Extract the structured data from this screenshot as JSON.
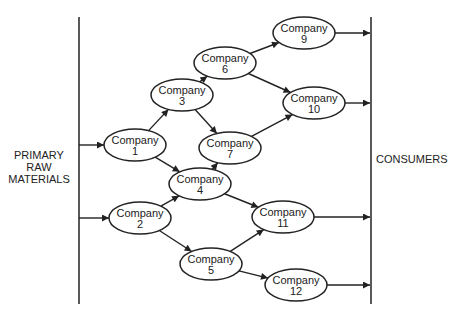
{
  "diagram": {
    "type": "supply-chain-network",
    "left_boundary": {
      "label_lines": [
        "PRIMARY",
        "RAW",
        "MATERIALS"
      ]
    },
    "right_boundary": {
      "label": "CONSUMERS"
    },
    "nodes": [
      {
        "id": "c1",
        "label": "Company",
        "number": "1",
        "cx": 135,
        "cy": 145
      },
      {
        "id": "c2",
        "label": "Company",
        "number": "2",
        "cx": 140,
        "cy": 218
      },
      {
        "id": "c3",
        "label": "Company",
        "number": "3",
        "cx": 182,
        "cy": 95
      },
      {
        "id": "c4",
        "label": "Company",
        "number": "4",
        "cx": 200,
        "cy": 184
      },
      {
        "id": "c5",
        "label": "Company",
        "number": "5",
        "cx": 211,
        "cy": 264
      },
      {
        "id": "c6",
        "label": "Company",
        "number": "6",
        "cx": 225,
        "cy": 63
      },
      {
        "id": "c7",
        "label": "Company",
        "number": "7",
        "cx": 230,
        "cy": 148
      },
      {
        "id": "c9",
        "label": "Company",
        "number": "9",
        "cx": 304,
        "cy": 33
      },
      {
        "id": "c10",
        "label": "Company",
        "number": "10",
        "cx": 314,
        "cy": 103
      },
      {
        "id": "c11",
        "label": "Company",
        "number": "11",
        "cx": 283,
        "cy": 217
      },
      {
        "id": "c12",
        "label": "Company",
        "number": "12",
        "cx": 296,
        "cy": 285
      }
    ],
    "edges": [
      {
        "from": "raw",
        "to": "c1"
      },
      {
        "from": "raw",
        "to": "c2"
      },
      {
        "from": "c1",
        "to": "c3"
      },
      {
        "from": "c1",
        "to": "c4"
      },
      {
        "from": "c2",
        "to": "c4"
      },
      {
        "from": "c2",
        "to": "c5"
      },
      {
        "from": "c3",
        "to": "c6"
      },
      {
        "from": "c3",
        "to": "c7"
      },
      {
        "from": "c4",
        "to": "c7"
      },
      {
        "from": "c4",
        "to": "c11"
      },
      {
        "from": "c5",
        "to": "c11"
      },
      {
        "from": "c5",
        "to": "c12"
      },
      {
        "from": "c6",
        "to": "c9"
      },
      {
        "from": "c6",
        "to": "c10"
      },
      {
        "from": "c7",
        "to": "c10"
      },
      {
        "from": "c9",
        "to": "consumers"
      },
      {
        "from": "c10",
        "to": "consumers"
      },
      {
        "from": "c11",
        "to": "consumers"
      },
      {
        "from": "c12",
        "to": "consumers"
      }
    ],
    "colors": {
      "stroke": "#222222",
      "background": "#ffffff"
    }
  }
}
